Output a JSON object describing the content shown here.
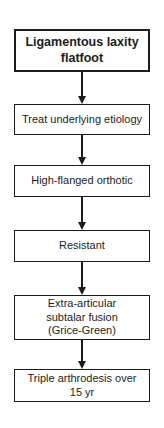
{
  "figure": {
    "type": "flowchart",
    "background_color": "#ffffff",
    "border_color": "#1c1c1c",
    "text_color": "#1c1c1c",
    "arrow_color": "#1c1c1c"
  },
  "nodes": [
    {
      "id": "ligamentous-laxity-flatfoot",
      "label": "Ligamentous laxity\nflatfoot",
      "emphasis": "bold"
    },
    {
      "id": "treat-underlying-etiology",
      "label": "Treat underlying etiology",
      "emphasis": "normal"
    },
    {
      "id": "high-flanged-orthotic",
      "label": "High-flanged orthotic",
      "emphasis": "normal"
    },
    {
      "id": "resistant",
      "label": "Resistant",
      "emphasis": "normal"
    },
    {
      "id": "extra-articular-subtalar-fusion",
      "label": "Extra-articular\nsubtalar fusion\n(Grice-Green)",
      "emphasis": "normal"
    },
    {
      "id": "triple-arthrodesis",
      "label": "Triple arthrodesis over\n15 yr",
      "emphasis": "normal"
    }
  ],
  "connections": [
    {
      "from": "ligamentous-laxity-flatfoot",
      "to": "treat-underlying-etiology",
      "direction": "down"
    },
    {
      "from": "treat-underlying-etiology",
      "to": "high-flanged-orthotic",
      "direction": "down"
    },
    {
      "from": "high-flanged-orthotic",
      "to": "resistant",
      "direction": "down"
    },
    {
      "from": "resistant",
      "to": "extra-articular-subtalar-fusion",
      "direction": "down"
    },
    {
      "from": "extra-articular-subtalar-fusion",
      "to": "triple-arthrodesis",
      "direction": "down"
    }
  ]
}
